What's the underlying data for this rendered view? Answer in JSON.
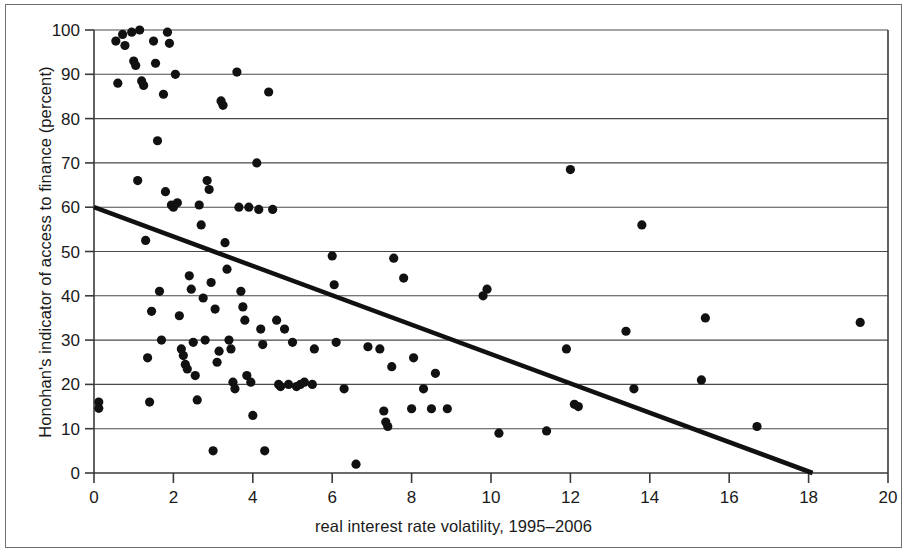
{
  "chart_data": {
    "type": "scatter",
    "title": "",
    "xlabel": "real interest rate volatility, 1995–2006",
    "ylabel": "Honohan's indicator of access to finance (percent)",
    "xlim": [
      0,
      20
    ],
    "ylim": [
      0,
      100
    ],
    "xticks": [
      0,
      2,
      4,
      6,
      8,
      10,
      12,
      14,
      16,
      18,
      20
    ],
    "yticks": [
      0,
      10,
      20,
      30,
      40,
      50,
      60,
      70,
      80,
      90,
      100
    ],
    "grid": "horizontal",
    "legend": "none",
    "marker_color": "#111111",
    "trendline_color": "#111111",
    "trendline": {
      "x": [
        0.0,
        18.1
      ],
      "y": [
        60.0,
        0.0
      ],
      "slope": -3.31,
      "intercept": 60.0
    },
    "points": [
      [
        0.12,
        16.0
      ],
      [
        0.12,
        14.6
      ],
      [
        0.55,
        97.5
      ],
      [
        0.6,
        88.0
      ],
      [
        0.72,
        99.0
      ],
      [
        0.78,
        96.5
      ],
      [
        0.95,
        99.5
      ],
      [
        1.0,
        93.0
      ],
      [
        1.05,
        92.0
      ],
      [
        1.1,
        66.0
      ],
      [
        1.15,
        100.0
      ],
      [
        1.2,
        88.5
      ],
      [
        1.25,
        87.5
      ],
      [
        1.3,
        52.5
      ],
      [
        1.35,
        26.0
      ],
      [
        1.4,
        16.0
      ],
      [
        1.45,
        36.5
      ],
      [
        1.5,
        97.5
      ],
      [
        1.55,
        92.5
      ],
      [
        1.6,
        75.0
      ],
      [
        1.65,
        41.0
      ],
      [
        1.7,
        30.0
      ],
      [
        1.75,
        85.5
      ],
      [
        1.8,
        63.5
      ],
      [
        1.85,
        99.5
      ],
      [
        1.9,
        97.0
      ],
      [
        1.95,
        60.5
      ],
      [
        2.0,
        60.0
      ],
      [
        2.05,
        90.0
      ],
      [
        2.1,
        61.0
      ],
      [
        2.15,
        35.5
      ],
      [
        2.2,
        28.0
      ],
      [
        2.25,
        26.5
      ],
      [
        2.3,
        24.5
      ],
      [
        2.35,
        23.5
      ],
      [
        2.4,
        44.5
      ],
      [
        2.45,
        41.5
      ],
      [
        2.5,
        29.5
      ],
      [
        2.55,
        22.0
      ],
      [
        2.6,
        16.5
      ],
      [
        2.65,
        60.5
      ],
      [
        2.7,
        56.0
      ],
      [
        2.75,
        39.5
      ],
      [
        2.8,
        30.0
      ],
      [
        2.85,
        66.0
      ],
      [
        2.9,
        64.0
      ],
      [
        2.95,
        43.0
      ],
      [
        3.0,
        5.0
      ],
      [
        3.05,
        37.0
      ],
      [
        3.1,
        25.0
      ],
      [
        3.15,
        27.5
      ],
      [
        3.2,
        84.0
      ],
      [
        3.25,
        83.0
      ],
      [
        3.3,
        52.0
      ],
      [
        3.35,
        46.0
      ],
      [
        3.4,
        30.0
      ],
      [
        3.45,
        28.0
      ],
      [
        3.5,
        20.5
      ],
      [
        3.55,
        19.0
      ],
      [
        3.6,
        90.5
      ],
      [
        3.65,
        60.0
      ],
      [
        3.7,
        41.0
      ],
      [
        3.75,
        37.5
      ],
      [
        3.8,
        34.5
      ],
      [
        3.85,
        22.0
      ],
      [
        3.9,
        60.0
      ],
      [
        3.95,
        20.5
      ],
      [
        4.0,
        13.0
      ],
      [
        4.1,
        70.0
      ],
      [
        4.15,
        59.5
      ],
      [
        4.2,
        32.5
      ],
      [
        4.25,
        29.0
      ],
      [
        4.3,
        5.0
      ],
      [
        4.4,
        86.0
      ],
      [
        4.5,
        59.5
      ],
      [
        4.6,
        34.5
      ],
      [
        4.65,
        20.0
      ],
      [
        4.7,
        19.5
      ],
      [
        4.8,
        32.5
      ],
      [
        4.9,
        20.0
      ],
      [
        5.0,
        29.5
      ],
      [
        5.1,
        19.5
      ],
      [
        5.2,
        20.0
      ],
      [
        5.3,
        20.5
      ],
      [
        5.5,
        20.0
      ],
      [
        5.55,
        28.0
      ],
      [
        6.0,
        49.0
      ],
      [
        6.05,
        42.5
      ],
      [
        6.1,
        29.5
      ],
      [
        6.3,
        19.0
      ],
      [
        6.6,
        2.0
      ],
      [
        6.9,
        28.5
      ],
      [
        7.2,
        28.0
      ],
      [
        7.3,
        14.0
      ],
      [
        7.35,
        11.5
      ],
      [
        7.4,
        10.5
      ],
      [
        7.5,
        24.0
      ],
      [
        7.55,
        48.5
      ],
      [
        7.8,
        44.0
      ],
      [
        8.0,
        14.5
      ],
      [
        8.05,
        26.0
      ],
      [
        8.3,
        19.0
      ],
      [
        8.5,
        14.5
      ],
      [
        8.6,
        22.5
      ],
      [
        8.9,
        14.5
      ],
      [
        9.8,
        40.0
      ],
      [
        9.9,
        41.5
      ],
      [
        10.2,
        9.0
      ],
      [
        11.4,
        9.5
      ],
      [
        11.9,
        28.0
      ],
      [
        12.0,
        68.5
      ],
      [
        12.1,
        15.5
      ],
      [
        12.2,
        15.0
      ],
      [
        13.4,
        32.0
      ],
      [
        13.6,
        19.0
      ],
      [
        13.8,
        56.0
      ],
      [
        15.3,
        21.0
      ],
      [
        15.4,
        35.0
      ],
      [
        16.7,
        10.5
      ],
      [
        19.3,
        34.0
      ]
    ]
  }
}
